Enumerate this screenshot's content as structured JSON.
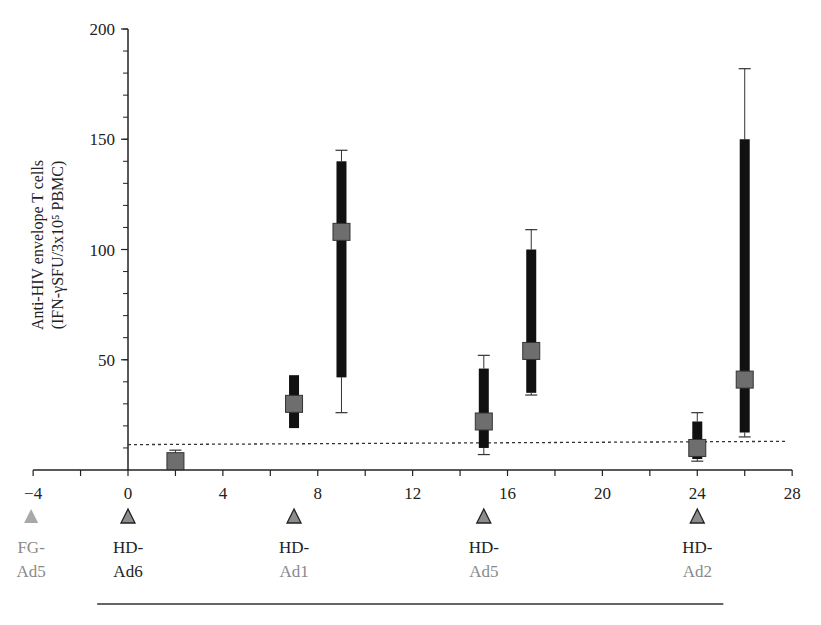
{
  "chart_data": {
    "type": "scatter",
    "title": "",
    "xlabel": "",
    "ylabel": "Anti-HIV envelope T cells",
    "ylabel_line2": "(IFN-γSFU/3x10⁵ PBMC)",
    "xlim": [
      -4,
      28
    ],
    "ylim": [
      0,
      200
    ],
    "x_ticks": [
      -4,
      0,
      4,
      8,
      12,
      16,
      20,
      24,
      28
    ],
    "x_tick_labels": [
      "−4",
      "0",
      "4",
      "8",
      "12",
      "16",
      "20",
      "24",
      "28"
    ],
    "x_minor_step": 2,
    "y_ticks": [
      50,
      100,
      150,
      200
    ],
    "y_tick_labels": [
      "50",
      "100",
      "150",
      "200"
    ],
    "y_minor_step": 10,
    "grid": false,
    "threshold_line": {
      "style": "dotted",
      "y_start": 11.5,
      "y_end": 13,
      "x_start": 0,
      "x_end": 27.8
    },
    "series": [
      {
        "name": "Anti-HIV envelope T cells",
        "points": [
          {
            "x": 2,
            "median": 4,
            "q1": 0,
            "q3": 7,
            "min": 0,
            "max": 9
          },
          {
            "x": 7,
            "median": 30,
            "q1": 19,
            "q3": 43,
            "min": 19,
            "max": 43
          },
          {
            "x": 9,
            "median": 108,
            "q1": 42,
            "q3": 140,
            "min": 26,
            "max": 145
          },
          {
            "x": 15,
            "median": 22,
            "q1": 10,
            "q3": 46,
            "min": 7,
            "max": 52
          },
          {
            "x": 17,
            "median": 54,
            "q1": 35,
            "q3": 100,
            "min": 34,
            "max": 109
          },
          {
            "x": 24,
            "median": 10,
            "q1": 5,
            "q3": 22,
            "min": 4,
            "max": 26
          },
          {
            "x": 26,
            "median": 41,
            "q1": 17,
            "q3": 150,
            "min": 15,
            "max": 182
          }
        ]
      }
    ],
    "vaccinations": [
      {
        "x": -4,
        "line1": "FG-",
        "line2": "Ad5",
        "style": "light"
      },
      {
        "x": 0,
        "line1": "HD-",
        "line2": "Ad6",
        "style": "outlined"
      },
      {
        "x": 7,
        "line1": "HD-",
        "line2": "Ad1",
        "style": "outlined"
      },
      {
        "x": 15,
        "line1": "HD-",
        "line2": "Ad5",
        "style": "outlined"
      },
      {
        "x": 24,
        "line1": "HD-",
        "line2": "Ad2",
        "style": "outlined"
      }
    ],
    "bracket": {
      "x_start": -1.3,
      "x_end": 25.1
    }
  },
  "colors": {
    "axis": "#222222",
    "bar": "#111111",
    "marker_fill": "#6e6e6e",
    "marker_stroke": "#333333",
    "triangle_fill": "#8c8c8c",
    "triangle_light": "#a8a8a8",
    "label_dark": "#222222",
    "label_gray": "#8a8a8a"
  }
}
